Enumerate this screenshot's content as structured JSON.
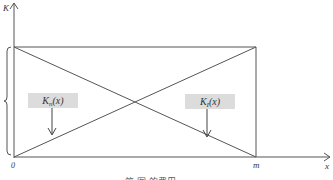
{
  "diagram": {
    "axes": {
      "y_label": "K",
      "x_label": "x",
      "origin_label": "0",
      "x_end_label": "m"
    },
    "curves": [
      {
        "name": "Kn",
        "label": "Kn(x)",
        "direction": "increasing from 0 to m"
      },
      {
        "name": "KI",
        "label": "KI(x)",
        "direction": "decreasing from 0 to m"
      }
    ],
    "annotations": {
      "kn_label": "K",
      "kn_sub": "n",
      "kn_arg": "(x)",
      "ki_label": "K",
      "ki_sub": "I",
      "ki_arg": "(x)"
    },
    "caption": "第  图   的费用"
  }
}
